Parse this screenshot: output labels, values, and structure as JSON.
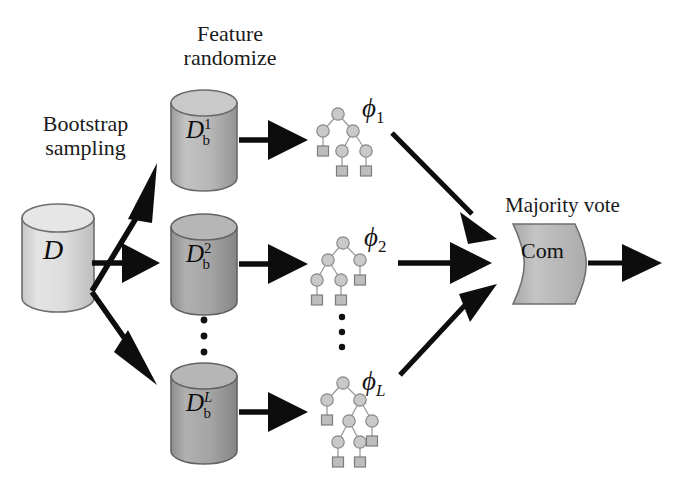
{
  "diagram": {
    "labels": {
      "feature_randomize": "Feature\nrandomize",
      "bootstrap_sampling": "Bootstrap\nsampling",
      "majority_vote": "Majority vote"
    },
    "source_dataset": {
      "name": "source-dataset-cylinder",
      "symbol": "D",
      "fill": "#d8d8d8"
    },
    "bootstrap_datasets": [
      {
        "name": "bootstrap-dataset-1",
        "symbol": "D",
        "superscript": "1",
        "subscript": "b",
        "fill": "#b3b3b3"
      },
      {
        "name": "bootstrap-dataset-2",
        "symbol": "D",
        "superscript": "2",
        "subscript": "b",
        "fill": "#9e9e9e"
      },
      {
        "name": "bootstrap-dataset-L",
        "symbol": "D",
        "superscript": "L",
        "subscript": "b",
        "fill": "#9a9a9a"
      }
    ],
    "trees": [
      {
        "name": "decision-tree-1",
        "label": "ϕ",
        "sub": "1"
      },
      {
        "name": "decision-tree-2",
        "label": "ϕ",
        "sub": "2"
      },
      {
        "name": "decision-tree-L",
        "label": "ϕ",
        "sub": "L"
      }
    ],
    "combiner": {
      "name": "combiner-block",
      "label": "Com",
      "fill": "#b9b9b9"
    },
    "ellipsis": {
      "glyph": "•",
      "count": 3
    },
    "colors": {
      "arrow": "#0d0d0d",
      "node_fill": "#c9c9c9",
      "node_stroke": "#8a8a8a",
      "leaf_fill": "#bdbdbd",
      "cylinder_stroke": "#6e6e6e",
      "background": "#ffffff"
    }
  }
}
